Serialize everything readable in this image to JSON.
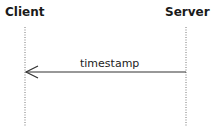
{
  "diagram": {
    "type": "sequence",
    "participants": [
      {
        "name": "Client"
      },
      {
        "name": "Server"
      }
    ],
    "messages": [
      {
        "from": "Server",
        "to": "Client",
        "label": "timestamp"
      }
    ]
  }
}
